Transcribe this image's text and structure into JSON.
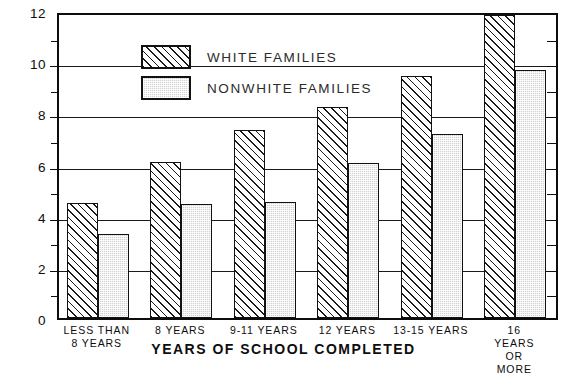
{
  "chart_data": {
    "type": "bar",
    "title": "",
    "xlabel": "YEARS OF SCHOOL COMPLETED",
    "ylabel": "",
    "categories": [
      "LESS THAN\n8 YEARS",
      "8 YEARS",
      "9-11 YEARS",
      "12 YEARS",
      "13-15 YEARS",
      "16 YEARS\nOR MORE"
    ],
    "series": [
      {
        "name": "WHITE FAMILIES",
        "values": [
          4.5,
          6.1,
          7.35,
          8.25,
          9.45,
          11.85
        ],
        "pattern": "diagonal-hatch",
        "color": "#ffffff"
      },
      {
        "name": "NONWHITE FAMILIES",
        "values": [
          3.3,
          4.45,
          4.55,
          6.05,
          7.2,
          9.7
        ],
        "pattern": "stipple",
        "color": "#d2d2d2"
      }
    ],
    "ylim": [
      0,
      12
    ],
    "ytick_labels": [
      "0",
      "2",
      "4",
      "6",
      "8",
      "10",
      "12"
    ],
    "ytick_values": [
      0,
      2,
      4,
      6,
      8,
      10,
      12
    ],
    "yminor_values": [
      1,
      3,
      5,
      7,
      9,
      11
    ],
    "grid": true,
    "grid_axis": "y",
    "legend_position": "top-left"
  },
  "legend": {
    "items": [
      {
        "label": "WHITE FAMILIES",
        "pattern": "diagonal-hatch"
      },
      {
        "label": "NONWHITE FAMILIES",
        "pattern": "stipple"
      }
    ]
  },
  "axis": {
    "x_title": "YEARS OF SCHOOL COMPLETED"
  }
}
